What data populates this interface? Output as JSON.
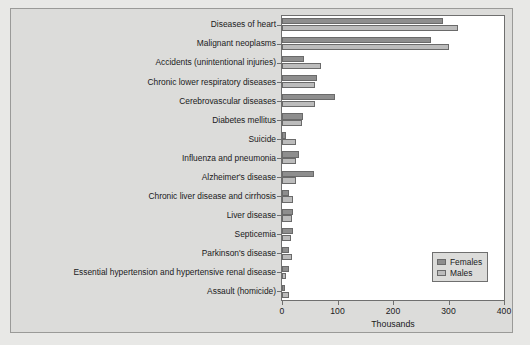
{
  "chart_data": {
    "type": "bar",
    "orientation": "horizontal",
    "title": "",
    "xlabel": "Thousands",
    "ylabel": "",
    "xlim": [
      0,
      400
    ],
    "xticks": [
      0,
      100,
      200,
      300,
      400
    ],
    "grid": false,
    "legend_position": "lower-right",
    "categories": [
      "Diseases of heart",
      "Malignant neoplasms",
      "Accidents (unintentional injuries)",
      "Chronic lower respiratory diseases",
      "Cerebrovascular diseases",
      "Diabetes mellitus",
      "Suicide",
      "Influenza and pneumonia",
      "Alzheimer's disease",
      "Chronic liver disease and cirrhosis",
      "Liver disease",
      "Septicemia",
      "Parkinson's disease",
      "Essential hypertension and hypertensive renal disease",
      "Assault (homicide)"
    ],
    "series": [
      {
        "name": "Females",
        "color": "#8e8e8e",
        "values": [
          290,
          268,
          40,
          63,
          95,
          38,
          8,
          30,
          57,
          12,
          20,
          19,
          12,
          13,
          5
        ]
      },
      {
        "name": "Males",
        "color": "#bcbcbc",
        "values": [
          318,
          301,
          70,
          60,
          60,
          36,
          25,
          26,
          25,
          20,
          18,
          17,
          18,
          8,
          13
        ]
      }
    ]
  },
  "legend": {
    "items": [
      {
        "label": "Females",
        "color": "#8e8e8e"
      },
      {
        "label": "Males",
        "color": "#bcbcbc"
      }
    ]
  },
  "axis": {
    "xlabel": "Thousands",
    "ticks": [
      "0",
      "100",
      "200",
      "300",
      "400"
    ]
  }
}
